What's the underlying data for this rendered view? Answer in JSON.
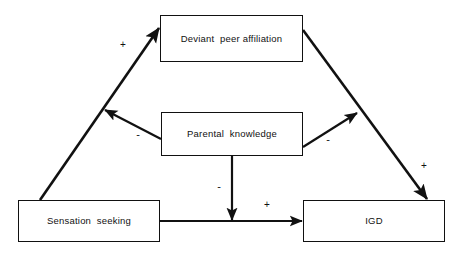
{
  "diagram": {
    "canvas": {
      "width": 465,
      "height": 257,
      "background": "#ffffff"
    },
    "stroke_color": "#111111",
    "nodes": [
      {
        "id": "deviant-peer-affiliation",
        "label": "Deviant  peer affiliation",
        "x": 160,
        "y": 15,
        "w": 143,
        "h": 47
      },
      {
        "id": "parental-knowledge",
        "label": "Parental  knowledge",
        "x": 161,
        "y": 112,
        "w": 142,
        "h": 44
      },
      {
        "id": "sensation-seeking",
        "label": "Sensation  seeking",
        "x": 18,
        "y": 200,
        "w": 142,
        "h": 42
      },
      {
        "id": "igd",
        "label": "IGD",
        "x": 303,
        "y": 200,
        "w": 142,
        "h": 42
      }
    ],
    "edges": [
      {
        "id": "sensation-to-deviant",
        "from": "sensation-seeking",
        "to": "deviant-peer-affiliation",
        "sign": "+",
        "sign_x": 123,
        "sign_y": 46,
        "weight": 2.6
      },
      {
        "id": "deviant-to-igd",
        "from": "deviant-peer-affiliation",
        "to": "igd",
        "sign": "+",
        "sign_x": 424,
        "sign_y": 167,
        "weight": 2.6
      },
      {
        "id": "sensation-to-igd",
        "from": "sensation-seeking",
        "to": "igd",
        "sign": "+",
        "sign_x": 267,
        "sign_y": 206,
        "weight": 2.2
      },
      {
        "id": "knowledge-moderates-sensation-to-deviant",
        "from": "parental-knowledge",
        "to": "sensation-to-deviant",
        "sign": "-",
        "sign_x": 138,
        "sign_y": 135,
        "weight": 2.2
      },
      {
        "id": "knowledge-moderates-deviant-to-igd",
        "from": "parental-knowledge",
        "to": "deviant-to-igd",
        "sign": "-",
        "sign_x": 328,
        "sign_y": 140,
        "weight": 2.2
      },
      {
        "id": "knowledge-to-sensation-to-igd-path",
        "from": "parental-knowledge",
        "to": "sensation-to-igd",
        "sign": "-",
        "sign_x": 219,
        "sign_y": 187,
        "weight": 2.2
      }
    ]
  }
}
